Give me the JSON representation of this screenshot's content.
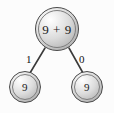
{
  "diagram": {
    "background_color": "#fcfcfc",
    "node_fill_color": "#dcdcdc",
    "node_stroke_color": "#4a4a4a",
    "edge_color": "#3a3a3a",
    "text_color": "#1a1a1a",
    "nodes": [
      {
        "id": "root",
        "label": "9 + 9",
        "role": "root-expression-node",
        "cx": 57,
        "cy": 29,
        "r": 22
      },
      {
        "id": "left",
        "label": "9",
        "role": "leaf-operand-node",
        "cx": 25,
        "cy": 87,
        "r": 16
      },
      {
        "id": "right",
        "label": "9",
        "role": "leaf-operand-node",
        "cx": 87,
        "cy": 87,
        "r": 16
      }
    ],
    "edges": [
      {
        "id": "root-to-left",
        "from": "root",
        "to": "left",
        "label": "1",
        "label_x": 26,
        "label_y": 54
      },
      {
        "id": "root-to-right",
        "from": "root",
        "to": "right",
        "label": "0",
        "label_x": 79,
        "label_y": 54
      }
    ]
  }
}
